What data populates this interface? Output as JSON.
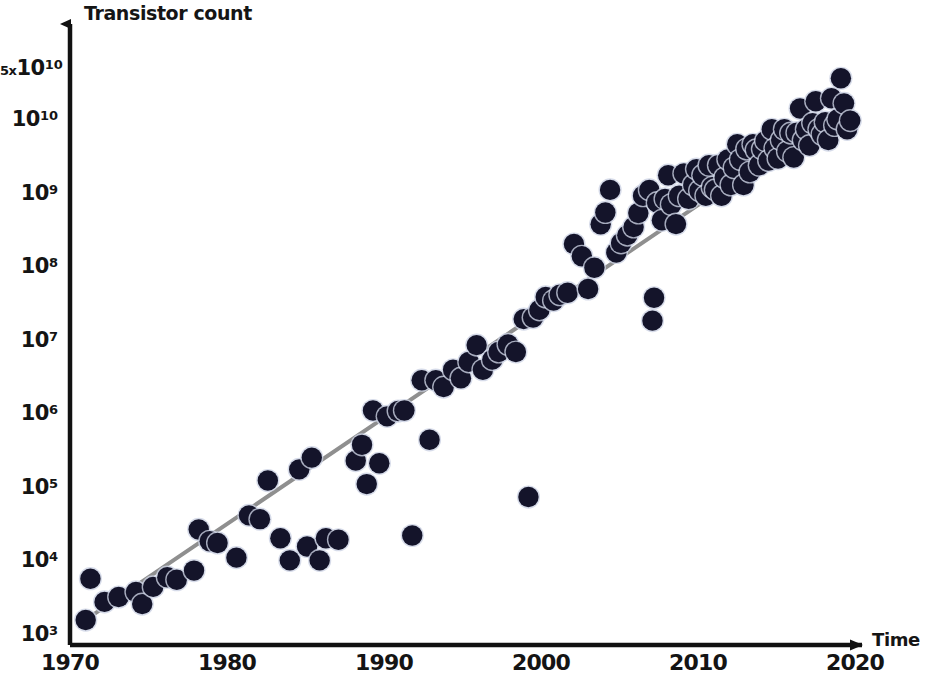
{
  "chart_data": {
    "type": "scatter",
    "title": "",
    "xlabel": "Time",
    "ylabel": "Transistor count",
    "yscale": "log",
    "xlim": [
      1970,
      2020
    ],
    "ylim": [
      1000,
      50000000000
    ],
    "grid": false,
    "legend": null,
    "y_tick_labels": [
      "5x10^10",
      "10^10",
      "10^9",
      "10^8",
      "10^7",
      "10^6",
      "10^5",
      "10^4",
      "10^3"
    ],
    "y_tick_values": [
      50000000000,
      10000000000,
      1000000000,
      100000000,
      10000000,
      1000000,
      100000,
      10000,
      1000
    ],
    "x_tick_labels": [
      "1970",
      "1980",
      "1990",
      "2000",
      "2010",
      "2020"
    ],
    "x_tick_values": [
      1970,
      1980,
      1990,
      2000,
      2010,
      2020
    ],
    "marker_color": "#14142a",
    "line_color": "#8f8f8f",
    "axis_color": "#111111",
    "trendline": {
      "x": [
        1971.6,
        2019.4
      ],
      "y": [
        2100,
        17000000000
      ]
    },
    "series": [
      {
        "name": "Transistor count",
        "points": [
          [
            1971.0,
            1700
          ],
          [
            1971.3,
            6200
          ],
          [
            1972.2,
            3000
          ],
          [
            1973.1,
            3500
          ],
          [
            1974.2,
            4100
          ],
          [
            1974.6,
            2800
          ],
          [
            1975.3,
            4800
          ],
          [
            1976.2,
            6500
          ],
          [
            1976.8,
            6000
          ],
          [
            1977.9,
            8000
          ],
          [
            1978.2,
            29000
          ],
          [
            1978.9,
            20000
          ],
          [
            1979.4,
            19000
          ],
          [
            1980.6,
            12000
          ],
          [
            1981.4,
            45000
          ],
          [
            1982.1,
            40000
          ],
          [
            1982.6,
            134000
          ],
          [
            1983.4,
            22000
          ],
          [
            1984.0,
            11000
          ],
          [
            1984.6,
            190000
          ],
          [
            1985.1,
            17000
          ],
          [
            1985.4,
            275000
          ],
          [
            1985.9,
            11000
          ],
          [
            1986.3,
            22000
          ],
          [
            1987.1,
            21000
          ],
          [
            1988.2,
            250000
          ],
          [
            1988.6,
            410000
          ],
          [
            1988.9,
            120000
          ],
          [
            1989.3,
            1200000
          ],
          [
            1989.7,
            230000
          ],
          [
            1990.2,
            1000000
          ],
          [
            1990.9,
            1180000
          ],
          [
            1991.3,
            1200000
          ],
          [
            1991.8,
            24000
          ],
          [
            1992.4,
            3100000
          ],
          [
            1992.9,
            480000
          ],
          [
            1993.3,
            3100000
          ],
          [
            1993.8,
            2500000
          ],
          [
            1994.4,
            4300000
          ],
          [
            1994.9,
            3300000
          ],
          [
            1995.4,
            5500000
          ],
          [
            1995.9,
            9300000
          ],
          [
            1996.3,
            4300000
          ],
          [
            1996.9,
            5900000
          ],
          [
            1997.3,
            7500000
          ],
          [
            1997.9,
            9500000
          ],
          [
            1998.4,
            7500000
          ],
          [
            1998.9,
            21000000
          ],
          [
            1999.2,
            80000
          ],
          [
            1999.5,
            22000000
          ],
          [
            1999.9,
            28000000
          ],
          [
            2000.3,
            42000000
          ],
          [
            2000.8,
            37500000
          ],
          [
            2001.2,
            45000000
          ],
          [
            2001.7,
            48000000
          ],
          [
            2002.1,
            220000000
          ],
          [
            2002.6,
            150000000
          ],
          [
            2003.0,
            54000000
          ],
          [
            2003.4,
            105000000
          ],
          [
            2003.8,
            410000000
          ],
          [
            2004.1,
            592000000
          ],
          [
            2004.4,
            1200000000
          ],
          [
            2004.8,
            169000000
          ],
          [
            2005.1,
            228000000
          ],
          [
            2005.5,
            291000000
          ],
          [
            2005.9,
            376000000
          ],
          [
            2006.2,
            582000000
          ],
          [
            2006.5,
            1000000000
          ],
          [
            2006.9,
            1200000000
          ],
          [
            2007.1,
            20000000
          ],
          [
            2007.2,
            41000000
          ],
          [
            2007.4,
            805000000
          ],
          [
            2007.7,
            463000000
          ],
          [
            2007.9,
            904000000
          ],
          [
            2008.1,
            1900000000
          ],
          [
            2008.3,
            758000000
          ],
          [
            2008.6,
            411000000
          ],
          [
            2008.8,
            1000000000
          ],
          [
            2009.1,
            2000000000
          ],
          [
            2009.4,
            904000000
          ],
          [
            2009.7,
            1400000000
          ],
          [
            2009.9,
            2300000000
          ],
          [
            2010.1,
            1170000000
          ],
          [
            2010.3,
            1900000000
          ],
          [
            2010.5,
            1000000000
          ],
          [
            2010.7,
            2600000000
          ],
          [
            2010.9,
            1300000000
          ],
          [
            2011.1,
            1200000000
          ],
          [
            2011.3,
            2600000000
          ],
          [
            2011.5,
            995000000
          ],
          [
            2011.7,
            1750000000
          ],
          [
            2011.9,
            3100000000
          ],
          [
            2012.1,
            1400000000
          ],
          [
            2012.3,
            2400000000
          ],
          [
            2012.5,
            5000000000
          ],
          [
            2012.7,
            3100000000
          ],
          [
            2012.9,
            1400000000
          ],
          [
            2013.1,
            4310000000
          ],
          [
            2013.3,
            2100000000
          ],
          [
            2013.5,
            5000000000
          ],
          [
            2013.7,
            4200000000
          ],
          [
            2013.9,
            2600000000
          ],
          [
            2014.1,
            4300000000
          ],
          [
            2014.3,
            5560000000
          ],
          [
            2014.5,
            3000000000
          ],
          [
            2014.7,
            8000000000
          ],
          [
            2014.9,
            4400000000
          ],
          [
            2015.1,
            3200000000
          ],
          [
            2015.3,
            5700000000
          ],
          [
            2015.5,
            8000000000
          ],
          [
            2015.7,
            4000000000
          ],
          [
            2015.9,
            7100000000
          ],
          [
            2016.1,
            3300000000
          ],
          [
            2016.3,
            7200000000
          ],
          [
            2016.5,
            15300000000
          ],
          [
            2016.7,
            5700000000
          ],
          [
            2016.9,
            8000000000
          ],
          [
            2017.1,
            4800000000
          ],
          [
            2017.3,
            9700000000
          ],
          [
            2017.5,
            19200000000
          ],
          [
            2017.7,
            8000000000
          ],
          [
            2017.9,
            6800000000
          ],
          [
            2018.1,
            10000000000
          ],
          [
            2018.3,
            5700000000
          ],
          [
            2018.5,
            21100000000
          ],
          [
            2018.7,
            9000000000
          ],
          [
            2018.9,
            11000000000
          ],
          [
            2019.1,
            39500000000
          ],
          [
            2019.3,
            18000000000
          ],
          [
            2019.5,
            8000000000
          ],
          [
            2019.7,
            10500000000
          ]
        ]
      }
    ]
  },
  "axes": {
    "y_title": "Transistor count",
    "x_title": "Time",
    "y_ticks": [
      {
        "pre": "5x",
        "mant": "10",
        "exp": "10",
        "value": 50000000000
      },
      {
        "pre": "",
        "mant": "10",
        "exp": "10",
        "value": 10000000000
      },
      {
        "pre": "",
        "mant": "10",
        "exp": "9",
        "value": 1000000000
      },
      {
        "pre": "",
        "mant": "10",
        "exp": "8",
        "value": 100000000
      },
      {
        "pre": "",
        "mant": "10",
        "exp": "7",
        "value": 10000000
      },
      {
        "pre": "",
        "mant": "10",
        "exp": "6",
        "value": 1000000
      },
      {
        "pre": "",
        "mant": "10",
        "exp": "5",
        "value": 100000
      },
      {
        "pre": "",
        "mant": "10",
        "exp": "4",
        "value": 10000
      },
      {
        "pre": "",
        "mant": "10",
        "exp": "3",
        "value": 1000
      }
    ],
    "x_ticks": [
      "1970",
      "1980",
      "1990",
      "2000",
      "2010",
      "2020"
    ]
  }
}
